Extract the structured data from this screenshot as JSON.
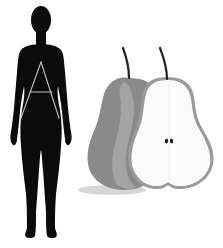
{
  "illustration": {
    "subject": "Pear body shape",
    "figure": {
      "icon": "female-silhouette-icon",
      "overlay_letter_icon": "letter-a-icon",
      "fill_color": "#0b0b0b",
      "line_color": "#bfbfbf"
    },
    "fruit": {
      "whole_pear_icon": "whole-pear-icon",
      "half_pear_icon": "halved-pear-icon",
      "whole_pear_color": "#8a8a8a",
      "whole_pear_highlight": "#a6a6a6",
      "flesh_color": "#fbfbfb",
      "rind_color": "#9a9a9a",
      "stem_color": "#222222",
      "seed_color": "#1a1a1a",
      "shadow_color": "#d6d6d6"
    },
    "background_color": "#ffffff"
  }
}
